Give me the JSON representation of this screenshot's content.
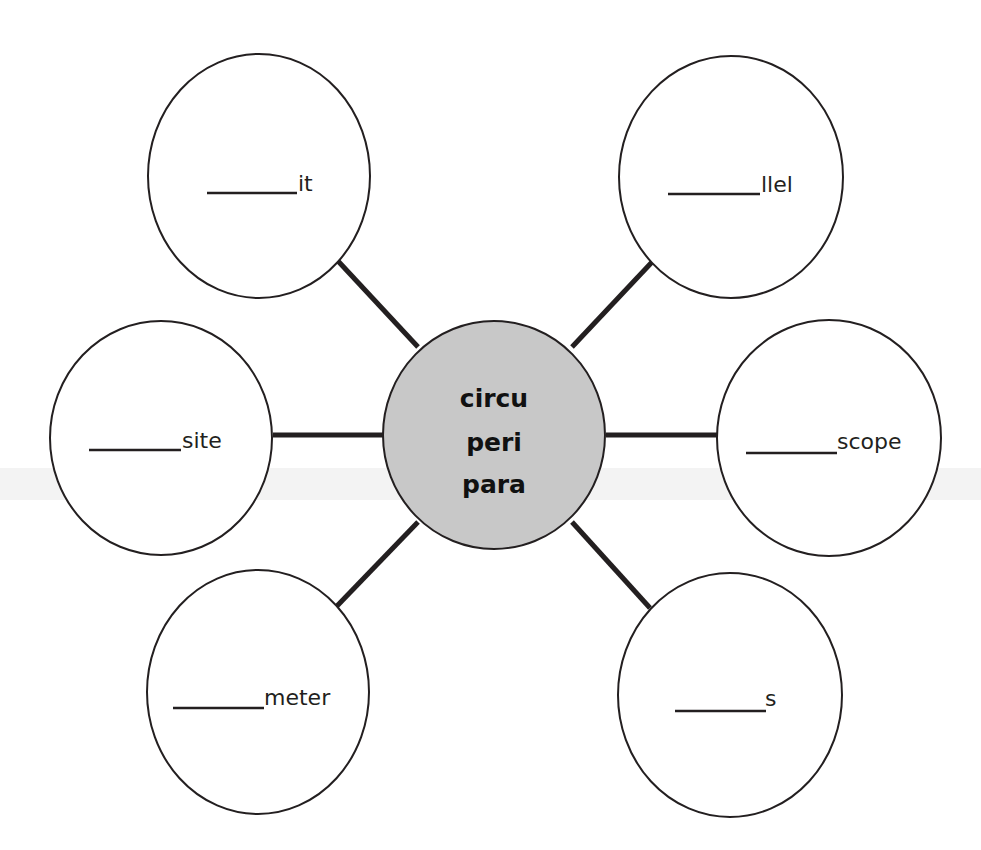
{
  "diagram": {
    "type": "word-web",
    "colors": {
      "background": "#ffffff",
      "center_fill": "#c8c8c8",
      "outline": "#231f20",
      "connector": "#231f20",
      "scan_band": "#f1f1f1"
    },
    "center": {
      "lines": [
        "circu",
        "peri",
        "para"
      ]
    },
    "nodes": [
      {
        "id": "top-left",
        "blank": "______",
        "suffix": "it"
      },
      {
        "id": "top-right",
        "blank": "______",
        "suffix": "llel"
      },
      {
        "id": "left",
        "blank": "______",
        "suffix": "site"
      },
      {
        "id": "right",
        "blank": "______",
        "suffix": "scope"
      },
      {
        "id": "bottom-left",
        "blank": "______",
        "suffix": "meter"
      },
      {
        "id": "bottom-right",
        "blank": "______",
        "suffix": "s"
      }
    ]
  }
}
